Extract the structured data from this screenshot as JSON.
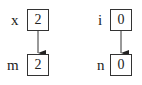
{
  "diagram": {
    "nodes": [
      {
        "id": "x",
        "label": "x",
        "value": "2"
      },
      {
        "id": "m",
        "label": "m",
        "value": "2"
      },
      {
        "id": "i",
        "label": "i",
        "value": "0"
      },
      {
        "id": "n",
        "label": "n",
        "value": "0"
      }
    ],
    "edges": [
      {
        "from": "x",
        "to": "m"
      },
      {
        "from": "i",
        "to": "n"
      }
    ]
  }
}
